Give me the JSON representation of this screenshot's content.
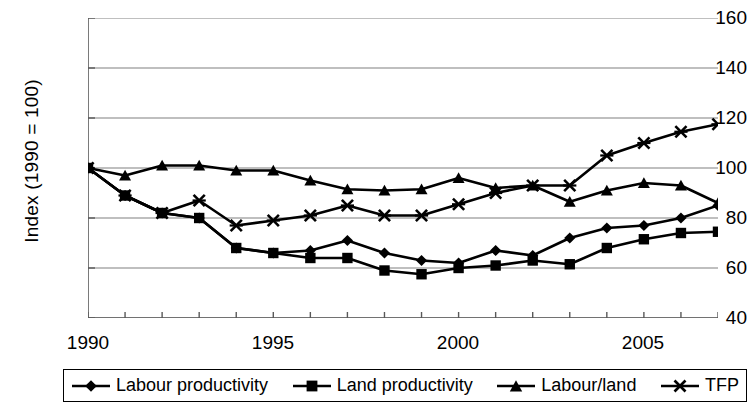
{
  "chart_data": {
    "type": "line",
    "title": "",
    "xlabel": "",
    "ylabel": "Index (1990 = 100)",
    "xlim": [
      1990,
      2007
    ],
    "ylim": [
      40,
      160
    ],
    "ytick_values": [
      160,
      140,
      120,
      100,
      80,
      60,
      40
    ],
    "xtick_values": [
      1990,
      1995,
      2000,
      2005
    ],
    "xtick_labels": [
      "1990",
      "1995",
      "2000",
      "2005"
    ],
    "ytick_labels": [
      "160",
      "140",
      "120",
      "100",
      "80",
      "60",
      "40"
    ],
    "grid": "horizontal",
    "legend_position": "bottom",
    "x": [
      1990,
      1991,
      1992,
      1993,
      1994,
      1995,
      1996,
      1997,
      1998,
      1999,
      2000,
      2001,
      2002,
      2003,
      2004,
      2005,
      2006,
      2007
    ],
    "series": [
      {
        "name": "Labour productivity",
        "marker": "diamond",
        "values": [
          100,
          89,
          82,
          80,
          68,
          66,
          67,
          71,
          66,
          63,
          62,
          67,
          65,
          72,
          76,
          77,
          80,
          85
        ]
      },
      {
        "name": "Land productivity",
        "marker": "square",
        "values": [
          100,
          89,
          82,
          80,
          68,
          66,
          64,
          64,
          59,
          57.5,
          60,
          61,
          63,
          61.5,
          68,
          71.5,
          74,
          74.5
        ]
      },
      {
        "name": "Labour/land",
        "marker": "triangle",
        "values": [
          100,
          97,
          101,
          101,
          99,
          99,
          95,
          91.5,
          91,
          91.5,
          96,
          92,
          93,
          86.5,
          91,
          94,
          93,
          86
        ]
      },
      {
        "name": "TFP",
        "marker": "cross",
        "values": [
          100,
          89,
          82,
          87,
          77,
          79,
          81,
          85,
          81,
          81,
          85.5,
          90,
          93,
          93,
          105,
          110,
          114.5,
          117.5
        ]
      }
    ]
  },
  "legend": {
    "items": [
      {
        "label": "Labour productivity",
        "marker": "diamond"
      },
      {
        "label": "Land productivity",
        "marker": "square"
      },
      {
        "label": "Labour/land",
        "marker": "triangle"
      },
      {
        "label": "TFP",
        "marker": "cross"
      }
    ]
  },
  "colors": {
    "series": "#000000",
    "grid": "#808080",
    "axis": "#595959",
    "background": "#ffffff"
  }
}
